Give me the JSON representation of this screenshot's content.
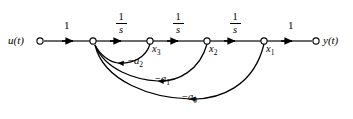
{
  "figure": {
    "type": "signal-flow-graph",
    "title": "",
    "line_color": "#000000",
    "background": "#ffffff"
  },
  "nodes": [
    {
      "id": "u",
      "label": "u(t)",
      "label_side": "left",
      "x": 40,
      "y": 41
    },
    {
      "id": "sum",
      "label": "",
      "label_side": "none",
      "x": 93,
      "y": 41
    },
    {
      "id": "x3",
      "label": "x",
      "sub": "3",
      "label_side": "below-right",
      "x": 150,
      "y": 41
    },
    {
      "id": "x2",
      "label": "x",
      "sub": "2",
      "label_side": "below-right",
      "x": 207,
      "y": 41
    },
    {
      "id": "x1",
      "label": "x",
      "sub": "1",
      "label_side": "below-right",
      "x": 264,
      "y": 41
    },
    {
      "id": "y",
      "label": "y(t)",
      "label_side": "right",
      "x": 316,
      "y": 41
    }
  ],
  "forward_branches": [
    {
      "from": "u",
      "to": "sum",
      "gain_kind": "plain",
      "gain": "1",
      "label_x": 66,
      "label_y": 23
    },
    {
      "from": "sum",
      "to": "x3",
      "gain_kind": "fraction",
      "num": "1",
      "den": "s",
      "label_x": 121,
      "label_y": 14
    },
    {
      "from": "x3",
      "to": "x2",
      "gain_kind": "fraction",
      "num": "1",
      "den": "s",
      "label_x": 178,
      "label_y": 14
    },
    {
      "from": "x2",
      "to": "x1",
      "gain_kind": "fraction",
      "num": "1",
      "den": "s",
      "label_x": 235,
      "label_y": 14
    },
    {
      "from": "x1",
      "to": "y",
      "gain_kind": "plain",
      "gain": "1",
      "label_x": 290,
      "label_y": 23
    }
  ],
  "feedback_branches": [
    {
      "from": "x3",
      "to": "sum",
      "gain_prefix": "−",
      "gain_base": "a",
      "gain_sub": "2",
      "label_x": 142,
      "label_y": 60
    },
    {
      "from": "x2",
      "to": "sum",
      "gain_prefix": "−",
      "gain_base": "a",
      "gain_sub": "1",
      "label_x": 168,
      "label_y": 78
    },
    {
      "from": "x1",
      "to": "sum",
      "gain_prefix": "−",
      "gain_base": "a",
      "gain_sub": "0",
      "label_x": 195,
      "label_y": 96
    }
  ],
  "terminal_labels": {
    "input": "u(t)",
    "output": "y(t)"
  },
  "state_labels": {
    "x3_base": "x",
    "x3_sub": "3",
    "x2_base": "x",
    "x2_sub": "2",
    "x1_base": "x",
    "x1_sub": "1"
  },
  "gain_labels": {
    "input_gain": "1",
    "output_gain": "1",
    "integrator_num": "1",
    "integrator_den": "s"
  },
  "feedback_labels": {
    "a2_prefix": "−",
    "a2_base": "a",
    "a2_sub": "2",
    "a1_prefix": "−",
    "a1_base": "a",
    "a1_sub": "1",
    "a0_prefix": "−",
    "a0_base": "a",
    "a0_sub": "0"
  }
}
